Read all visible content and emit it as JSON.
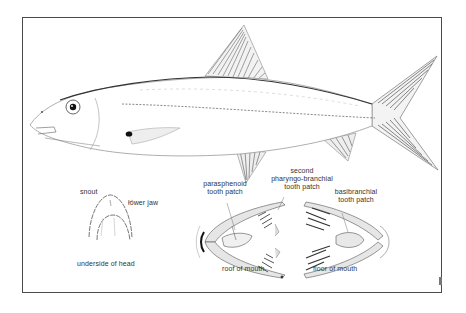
{
  "figure": {
    "frame_color": "#4a4a4a",
    "ink_color": "#333333"
  },
  "labels": {
    "snout": "snout",
    "lower_jaw": "lower jaw",
    "underside_of_head": "underside of head",
    "parasphenoid_line1": "parasphenoid",
    "parasphenoid_line2": "tooth patch",
    "second_pb_line1": "second",
    "second_pb_line2": "pharyngo-branchial",
    "second_pb_line3": "tooth patch",
    "basibranchial_line1": "basibranchial",
    "basibranchial_line2": "tooth patch",
    "roof_of_mouth": "roof of mouth",
    "floor_of_mouth": "floor of mouth"
  }
}
